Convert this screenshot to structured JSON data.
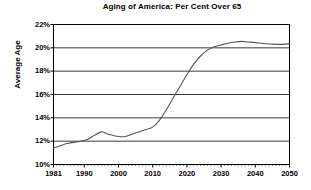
{
  "chart_data": {
    "type": "line",
    "title": "Aging of America: Per Cent Over 65",
    "xlabel": "",
    "ylabel": "Average Age",
    "xlim": [
      1981,
      2050
    ],
    "ylim": [
      10,
      22
    ],
    "y_tick_labels": [
      "22%",
      "20%",
      "18%",
      "16%",
      "14%",
      "12%",
      "10%"
    ],
    "y_ticks": [
      22,
      20,
      18,
      16,
      14,
      12,
      10
    ],
    "x_tick_labels": [
      "1981",
      "1990",
      "2000",
      "2010",
      "2020",
      "2030",
      "2040",
      "2050"
    ],
    "x_ticks": [
      1981,
      1990,
      2000,
      2010,
      2020,
      2030,
      2040,
      2050
    ],
    "grid": "horizontal",
    "legend": "none",
    "line_color": "#555555",
    "axis_color": "#000000",
    "series": [
      {
        "name": "Per Cent Over 65",
        "x": [
          1981,
          1985,
          1990,
          1993,
          1995,
          1997,
          2000,
          2002,
          2005,
          2008,
          2010,
          2012,
          2014,
          2016,
          2018,
          2020,
          2022,
          2024,
          2026,
          2028,
          2030,
          2032,
          2034,
          2036,
          2038,
          2040,
          2043,
          2046,
          2048,
          2050
        ],
        "values": [
          11.4,
          11.8,
          12.05,
          12.5,
          12.8,
          12.6,
          12.4,
          12.4,
          12.7,
          13.0,
          13.2,
          13.8,
          14.7,
          15.7,
          16.7,
          17.7,
          18.6,
          19.3,
          19.8,
          20.1,
          20.25,
          20.4,
          20.5,
          20.55,
          20.5,
          20.45,
          20.35,
          20.3,
          20.3,
          20.35
        ]
      }
    ]
  }
}
